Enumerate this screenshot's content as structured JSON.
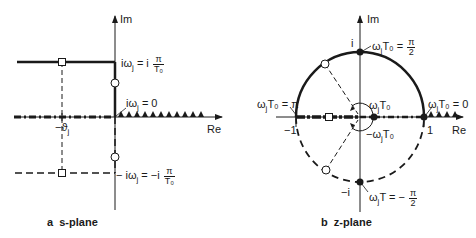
{
  "s_plane": {
    "caption_letter": "a",
    "caption_text": "s-plane",
    "axis_im": "Im",
    "axis_re": "Re",
    "label_top_prefix": "iω",
    "label_top_sub": "j",
    "label_top_eq": " = i",
    "label_top_num": "π",
    "label_top_den": "T₀",
    "label_zero_prefix": "iω",
    "label_zero_sub": "j",
    "label_zero_eq": " = 0",
    "label_sigma": "−ϑ",
    "label_sigma_sub": "j",
    "label_bottom_prefix": "− iω",
    "label_bottom_sub": "j",
    "label_bottom_eq": " = −i",
    "label_bottom_num": "π",
    "label_bottom_den": "T₀"
  },
  "z_plane": {
    "caption_letter": "b",
    "caption_text": "z-plane",
    "axis_im": "Im",
    "axis_re": "Re",
    "tick_i": "i",
    "tick_minus_i": "−i",
    "tick_one": "1",
    "tick_minus_one": "−1",
    "label_top_prefix": "ω",
    "label_top_sub": "j",
    "label_top_eq": "T₀ =",
    "label_top_num": "π",
    "label_top_den": "2",
    "label_pi_prefix": "ω",
    "label_pi_sub": "j",
    "label_pi_eq": "T₀ = π",
    "label_zero_prefix": "ω",
    "label_zero_sub": "j",
    "label_zero_eq": "T₀ = 0",
    "label_angle_pos_prefix": "ω",
    "label_angle_pos_sub": "j",
    "label_angle_pos_eq": "T₀",
    "label_angle_neg_prefix": "−ω",
    "label_angle_neg_sub": "j",
    "label_angle_neg_eq": "T₀",
    "label_bottom_prefix": "ω",
    "label_bottom_sub": "j",
    "label_bottom_eq": "T  = −",
    "label_bottom_num": "π",
    "label_bottom_den": "2"
  },
  "colors": {
    "ink": "#1a1a1a",
    "background": "#ffffff"
  }
}
